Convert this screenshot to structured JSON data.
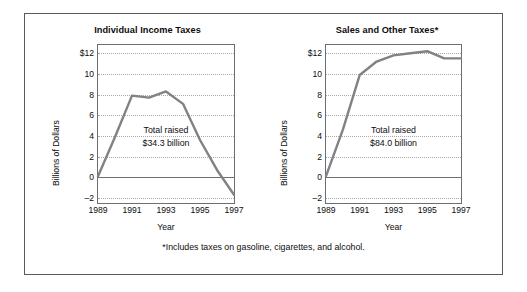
{
  "figure": {
    "footnote": "*Includes taxes on gasoline, cigarettes, and alcohol.",
    "border_color": "#58595b",
    "line_color": "#808285"
  },
  "chart_data": [
    {
      "type": "line",
      "title": "Individual Income Taxes",
      "xlabel": "Year",
      "ylabel": "Billions of Dollars",
      "annotation": "Total raised\n$34.3 billion",
      "annotation_line1": "Total raised",
      "annotation_line2": "$34.3 billion",
      "x": [
        1989,
        1990,
        1991,
        1992,
        1993,
        1994,
        1995,
        1996,
        1997
      ],
      "values": [
        0.1,
        3.9,
        7.9,
        7.7,
        8.3,
        7.1,
        3.6,
        0.7,
        -1.7
      ],
      "xlim": [
        1989,
        1997
      ],
      "ylim": [
        -2.5,
        12.8
      ],
      "yticks": [
        -2,
        0,
        2,
        4,
        6,
        8,
        10,
        12
      ],
      "ytick_labels": [
        "–2",
        "0",
        "2",
        "4",
        "6",
        "8",
        "10",
        "$12"
      ],
      "xticks": [
        1989,
        1991,
        1993,
        1995,
        1997
      ],
      "xtick_labels": [
        "1989",
        "1991",
        "1993",
        "1995",
        "1997"
      ],
      "grid": "horizontal-dotted",
      "legend": "none",
      "total_raised_billion": 34.3
    },
    {
      "type": "line",
      "title": "Sales and Other Taxes*",
      "xlabel": "Year",
      "ylabel": "Billions of Dollars",
      "annotation": "Total raised\n$84.0 billion",
      "annotation_line1": "Total raised",
      "annotation_line2": "$84.0 billion",
      "x": [
        1989,
        1990,
        1991,
        1992,
        1993,
        1994,
        1995,
        1996,
        1997
      ],
      "values": [
        0.1,
        4.6,
        9.9,
        11.2,
        11.8,
        12.0,
        12.2,
        11.5,
        11.5
      ],
      "xlim": [
        1989,
        1997
      ],
      "ylim": [
        -2.5,
        12.8
      ],
      "yticks": [
        -2,
        0,
        2,
        4,
        6,
        8,
        10,
        12
      ],
      "ytick_labels": [
        "–2",
        "0",
        "2",
        "4",
        "6",
        "8",
        "10",
        "$12"
      ],
      "xticks": [
        1989,
        1991,
        1993,
        1995,
        1997
      ],
      "xtick_labels": [
        "1989",
        "1991",
        "1993",
        "1995",
        "1997"
      ],
      "grid": "horizontal-dotted",
      "legend": "none",
      "total_raised_billion": 84.0
    }
  ]
}
